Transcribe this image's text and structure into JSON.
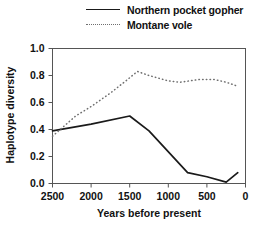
{
  "legend": {
    "entries": [
      {
        "label": "Northern pocket gopher",
        "style": "solid",
        "color": "#1a1a1a"
      },
      {
        "label": "Montane vole",
        "style": "dotted",
        "color": "#6f6f6f"
      }
    ]
  },
  "chart_data": {
    "type": "line",
    "title": "",
    "xlabel": "Years before present",
    "ylabel": "Haplotype diversity",
    "xlim": [
      2500,
      0
    ],
    "ylim": [
      0.0,
      1.0
    ],
    "x_reversed": true,
    "grid": false,
    "legend_position": "top",
    "xticks": [
      2500,
      2000,
      1500,
      1000,
      500,
      0
    ],
    "xtick_labels": [
      "2500",
      "2000",
      "1500",
      "1000",
      "500",
      "0"
    ],
    "yticks": [
      0.0,
      0.2,
      0.4,
      0.6,
      0.8,
      1.0
    ],
    "ytick_labels": [
      "0.0",
      "0.2",
      "0.4",
      "0.6",
      "0.8",
      "1.0"
    ],
    "series": [
      {
        "name": "Northern pocket gopher",
        "style": "solid",
        "color": "#1a1a1a",
        "x": [
          2500,
          2000,
          1500,
          1250,
          750,
          500,
          250,
          100
        ],
        "values": [
          0.39,
          0.44,
          0.5,
          0.39,
          0.08,
          0.05,
          0.01,
          0.08
        ]
      },
      {
        "name": "Montane vole",
        "style": "dotted",
        "color": "#6f6f6f",
        "x": [
          2500,
          2200,
          2000,
          1750,
          1550,
          1400,
          1250,
          1000,
          850,
          600,
          400,
          250,
          100
        ],
        "values": [
          0.35,
          0.5,
          0.57,
          0.67,
          0.76,
          0.83,
          0.8,
          0.76,
          0.75,
          0.77,
          0.77,
          0.75,
          0.72
        ]
      }
    ]
  }
}
